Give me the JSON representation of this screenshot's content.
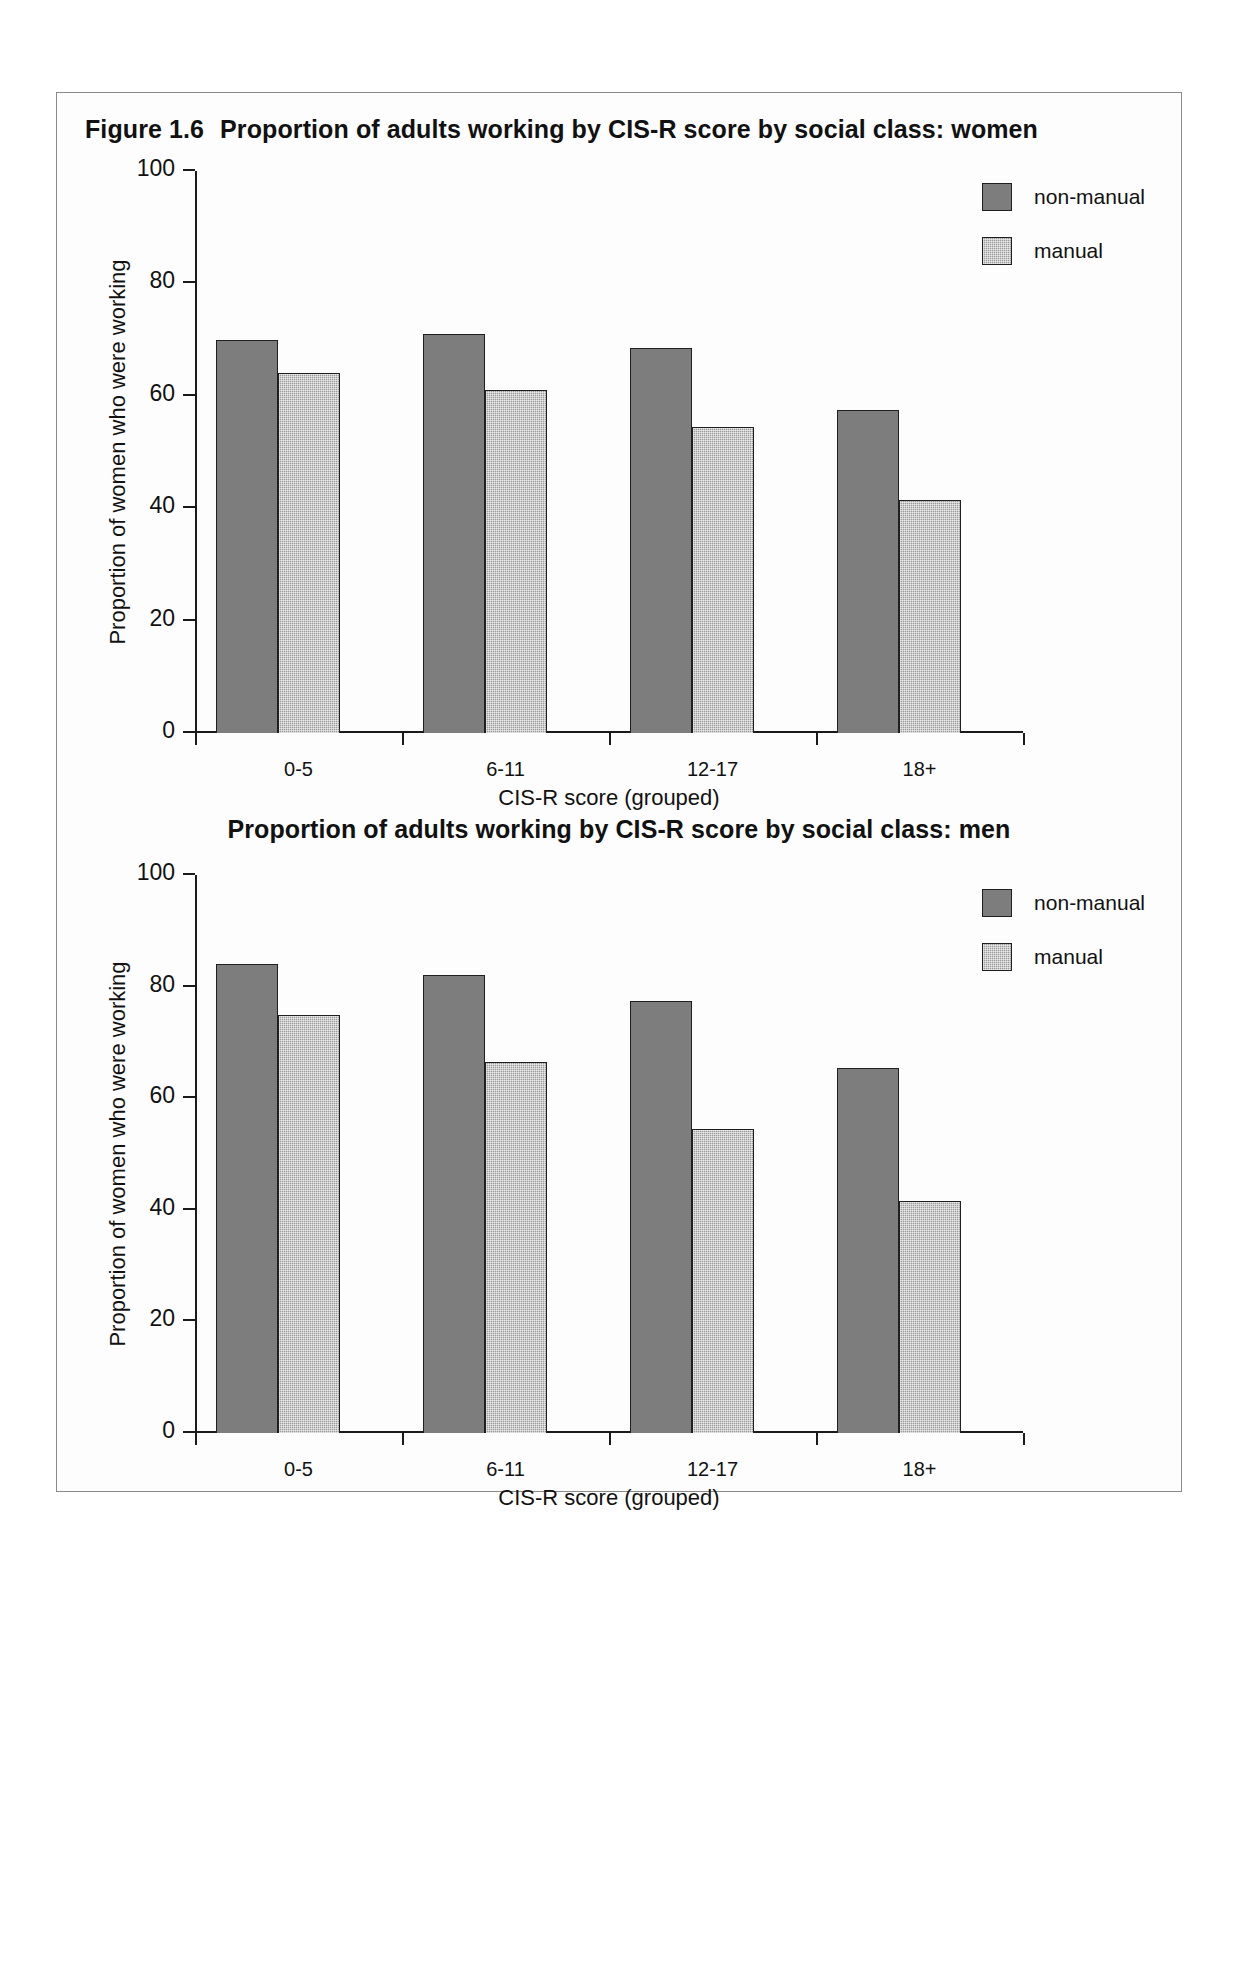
{
  "figures": [
    {
      "number": "Figure 1.6",
      "title": "Proportion of adults working by CIS-R score by social class: women",
      "ylabel": "Proportion of women who were working",
      "xlabel": "CIS-R score (grouped)",
      "legend": [
        {
          "label": "non-manual",
          "swatch": "nonmanual"
        },
        {
          "label": "manual",
          "swatch": "manual"
        }
      ],
      "yticks": [
        "100",
        "80",
        "60",
        "40",
        "20",
        "0"
      ],
      "xticks": [
        "0-5",
        "6-11",
        "12-17",
        "18+"
      ]
    },
    {
      "number": "",
      "title": "Proportion of adults working by CIS-R score by social class: men",
      "ylabel": "Proportion of women who were working",
      "xlabel": "CIS-R score (grouped)",
      "legend": [
        {
          "label": "non-manual",
          "swatch": "nonmanual"
        },
        {
          "label": "manual",
          "swatch": "manual"
        }
      ],
      "yticks": [
        "100",
        "80",
        "60",
        "40",
        "20",
        "0"
      ],
      "xticks": [
        "0-5",
        "6-11",
        "12-17",
        "18+"
      ]
    }
  ],
  "chart_data": [
    {
      "type": "bar",
      "title": "Figure 1.6  Proportion of adults working by CIS-R score by social class: women",
      "xlabel": "CIS-R score (grouped)",
      "ylabel": "Proportion of women who were working",
      "categories": [
        "0-5",
        "6-11",
        "12-17",
        "18+"
      ],
      "series": [
        {
          "name": "non-manual",
          "values": [
            70,
            71,
            68.5,
            57.5
          ]
        },
        {
          "name": "manual",
          "values": [
            64,
            61,
            54.5,
            41.5
          ]
        }
      ],
      "ylim": [
        0,
        100
      ],
      "yticks": [
        0,
        20,
        40,
        60,
        80,
        100
      ],
      "grid": false,
      "legend_position": "top-right"
    },
    {
      "type": "bar",
      "title": "Proportion of adults working by CIS-R score by social class: men",
      "xlabel": "CIS-R score (grouped)",
      "ylabel": "Proportion of women who were working",
      "categories": [
        "0-5",
        "6-11",
        "12-17",
        "18+"
      ],
      "series": [
        {
          "name": "non-manual",
          "values": [
            84,
            82,
            77.5,
            65.5
          ]
        },
        {
          "name": "manual",
          "values": [
            75,
            66.5,
            54.5,
            41.5
          ]
        }
      ],
      "ylim": [
        0,
        100
      ],
      "yticks": [
        0,
        20,
        40,
        60,
        80,
        100
      ],
      "grid": false,
      "legend_position": "top-right"
    }
  ],
  "colors": {
    "nonmanual": "#7d7d7d",
    "manual": "#9a9a9a",
    "axis": "#1a1a1a",
    "text": "#111111",
    "frame": "#8a8a8a"
  }
}
